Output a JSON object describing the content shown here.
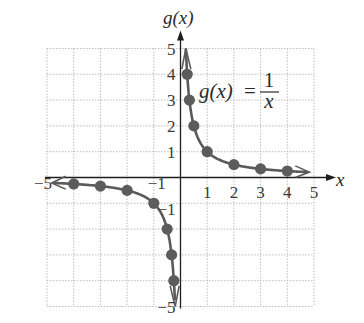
{
  "chart_data": {
    "type": "line",
    "title": "",
    "function_label": {
      "lhs": "g(x)",
      "equals": "=",
      "numerator": "1",
      "denominator": "x"
    },
    "xlabel": "x",
    "ylabel": "g(x)",
    "xlim": [
      -5,
      5
    ],
    "ylim": [
      -5,
      5
    ],
    "grid": true,
    "x_ticks": [
      "-5",
      "-1",
      "1",
      "2",
      "3",
      "4",
      "5"
    ],
    "y_ticks": [
      "5",
      "4",
      "3",
      "2",
      "1",
      "-1",
      "-5"
    ],
    "series": [
      {
        "name": "g(x) = 1/x, x > 0",
        "points": [
          {
            "x": 0.25,
            "y": 4
          },
          {
            "x": 0.333,
            "y": 3
          },
          {
            "x": 0.5,
            "y": 2
          },
          {
            "x": 1,
            "y": 1
          },
          {
            "x": 2,
            "y": 0.5
          },
          {
            "x": 3,
            "y": 0.333
          },
          {
            "x": 4,
            "y": 0.25
          }
        ]
      },
      {
        "name": "g(x) = 1/x, x < 0",
        "points": [
          {
            "x": -4,
            "y": -0.25
          },
          {
            "x": -3,
            "y": -0.333
          },
          {
            "x": -2,
            "y": -0.5
          },
          {
            "x": -1,
            "y": -1
          },
          {
            "x": -0.5,
            "y": -2
          },
          {
            "x": -0.333,
            "y": -3
          },
          {
            "x": -0.25,
            "y": -4
          }
        ]
      }
    ],
    "colors": {
      "curve": "#5a5a5a",
      "points": "#5c5c5c",
      "axis": "#1e1e1e",
      "grid": "#bdbdbd"
    }
  }
}
